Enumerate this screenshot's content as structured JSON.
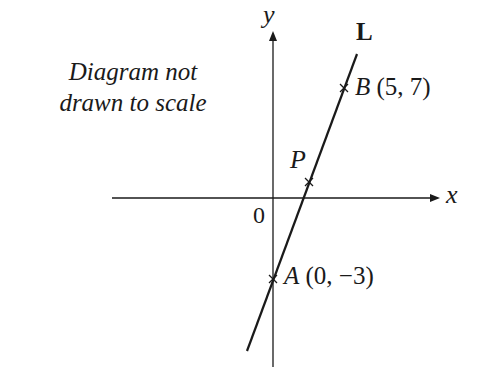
{
  "diagram": {
    "note": {
      "line1": "Diagram not",
      "line2": "drawn to scale"
    },
    "axes": {
      "x_label": "x",
      "y_label": "y",
      "origin_label": "0"
    },
    "line": {
      "name": "L"
    },
    "points": [
      {
        "name": "B",
        "coords": "(5, 7)"
      },
      {
        "name": "P",
        "coords": ""
      },
      {
        "name": "A",
        "coords": "(0, −3)"
      }
    ],
    "colors": {
      "ink": "#1a1a1a",
      "background": "#ffffff"
    }
  }
}
